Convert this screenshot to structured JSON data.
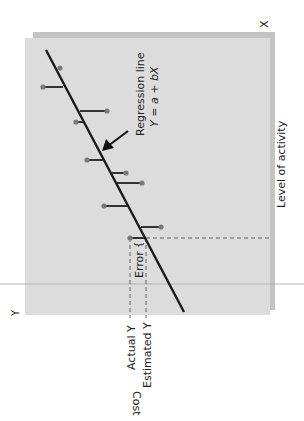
{
  "diagram": {
    "orientation": "rotated 90 degrees clockwise",
    "axes": {
      "x_symbol": "X",
      "y_symbol": "Y",
      "x_label": "Level of activity",
      "y_label": "Cost"
    },
    "regression": {
      "label_line1": "Regression line",
      "label_line2": "Y = a + bX"
    },
    "annotations": {
      "error": "Error",
      "actual_y": "Actual Y",
      "estimated_y": "Estimated Y"
    },
    "colors": {
      "panel": "#dcdcdc",
      "panel_shadow": "#bdbdbd",
      "line": "#1a1a1a",
      "residual": "#333333",
      "point": "#7a7a7a",
      "dashed": "#555555",
      "divider": "#9a9a9a"
    },
    "regression_line": {
      "x1": 46,
      "y1": 50,
      "x2": 184,
      "y2": 312
    },
    "residuals": [
      {
        "dot_x": 43,
        "line_x": 63,
        "y": 87
      },
      {
        "dot_x": 60,
        "line_x": 60,
        "y": 68
      },
      {
        "dot_x": 107,
        "line_x": 80,
        "y": 111
      },
      {
        "dot_x": 76,
        "line_x": 83,
        "y": 122
      },
      {
        "dot_x": 87,
        "line_x": 104,
        "y": 160
      },
      {
        "dot_x": 126,
        "line_x": 112,
        "y": 173
      },
      {
        "dot_x": 142,
        "line_x": 117,
        "y": 183
      },
      {
        "dot_x": 104,
        "line_x": 127,
        "y": 206
      },
      {
        "dot_x": 161,
        "line_x": 141,
        "y": 227
      },
      {
        "dot_x": 130,
        "line_x": 146,
        "y": 238
      }
    ]
  }
}
